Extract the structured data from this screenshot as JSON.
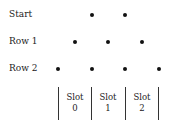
{
  "rows": [
    {
      "label": "Start"
    },
    {
      "label": "Row 1"
    },
    {
      "label": "Row 2"
    }
  ],
  "slots": [
    {
      "word": "Slot",
      "num": "0"
    },
    {
      "word": "Slot",
      "num": "1"
    },
    {
      "word": "Slot",
      "num": "2"
    }
  ]
}
